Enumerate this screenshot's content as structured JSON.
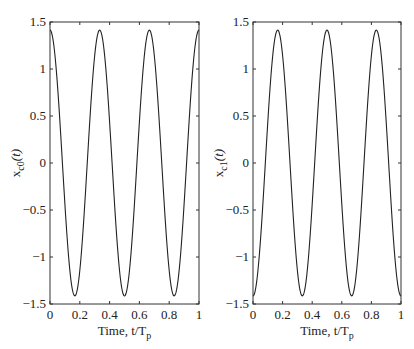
{
  "chart_data": [
    {
      "type": "line",
      "title": "",
      "xlabel": "Time, t/T_p",
      "ylabel": "x_c0(t)",
      "xlim": [
        0,
        1
      ],
      "ylim": [
        -1.5,
        1.5
      ],
      "xticks": [
        0,
        0.2,
        0.4,
        0.6,
        0.8,
        1
      ],
      "xtick_labels": [
        "0",
        "0.2",
        "0.4",
        "0.6",
        "0.8",
        "1"
      ],
      "yticks": [
        1.5,
        1,
        0.5,
        0,
        -0.5,
        -1,
        -1.5
      ],
      "ytick_labels": [
        "1.5",
        "1",
        "0.5",
        "0",
        "−0.5",
        "−1",
        "−1.5"
      ],
      "grid": false,
      "legend": null,
      "series": [
        {
          "name": "x_c0(t)",
          "formula": "1.414*cos(6*pi*t)",
          "x": [
            0,
            0.0833,
            0.1667,
            0.25,
            0.3333,
            0.4167,
            0.5,
            0.5833,
            0.6667,
            0.75,
            0.8333,
            0.9167,
            1
          ],
          "values": [
            1.414,
            0,
            -1.414,
            0,
            1.414,
            0,
            -1.414,
            0,
            1.414,
            0,
            -1.414,
            0,
            1.414
          ]
        }
      ]
    },
    {
      "type": "line",
      "title": "",
      "xlabel": "Time, t/T_p",
      "ylabel": "x_c1(t)",
      "xlim": [
        0,
        1
      ],
      "ylim": [
        -1.5,
        1.5
      ],
      "xticks": [
        0,
        0.2,
        0.4,
        0.6,
        0.8,
        1
      ],
      "xtick_labels": [
        "0",
        "0.2",
        "0.4",
        "0.6",
        "0.8",
        "1"
      ],
      "yticks": [
        1.5,
        1,
        0.5,
        0,
        -0.5,
        -1,
        -1.5
      ],
      "ytick_labels": [
        "1.5",
        "1",
        "0.5",
        "0",
        "−0.5",
        "−1",
        "−1.5"
      ],
      "grid": false,
      "legend": null,
      "series": [
        {
          "name": "x_c1(t)",
          "formula": "-1.414*cos(6*pi*t)",
          "x": [
            0,
            0.0833,
            0.1667,
            0.25,
            0.3333,
            0.4167,
            0.5,
            0.5833,
            0.6667,
            0.75,
            0.8333,
            0.9167,
            1
          ],
          "values": [
            -1.414,
            0,
            1.414,
            0,
            -1.414,
            0,
            1.414,
            0,
            -1.414,
            0,
            1.414,
            0,
            -1.414
          ]
        }
      ]
    }
  ],
  "labels": {
    "left_ylabel_main": "x",
    "left_ylabel_sub": "c0",
    "left_ylabel_arg": "(t)",
    "right_ylabel_main": "x",
    "right_ylabel_sub": "c1",
    "right_ylabel_arg": "(t)",
    "xlabel_main": "Time, t/T",
    "xlabel_sub": "p"
  }
}
